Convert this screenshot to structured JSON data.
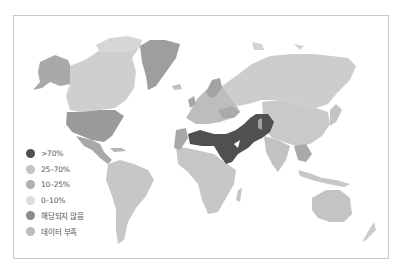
{
  "map": {
    "type": "choropleth-world",
    "colors": {
      "gt70": "#505050",
      "p25_70": "#c4c4c4",
      "p10_25": "#b0b0b0",
      "p0_10": "#dcdcdc",
      "not_applicable": "#8a8a8a",
      "no_data": "#bdbdbd"
    }
  },
  "legend": {
    "items": [
      {
        "label": ">70%",
        "color": "#505050"
      },
      {
        "label": "25–70%",
        "color": "#c4c4c4"
      },
      {
        "label": "10–25%",
        "color": "#b0b0b0"
      },
      {
        "label": "0–10%",
        "color": "#dcdcdc"
      },
      {
        "label": "해당되지 않음",
        "color": "#8a8a8a"
      },
      {
        "label": "데이터 부족",
        "color": "#bdbdbd"
      }
    ]
  }
}
